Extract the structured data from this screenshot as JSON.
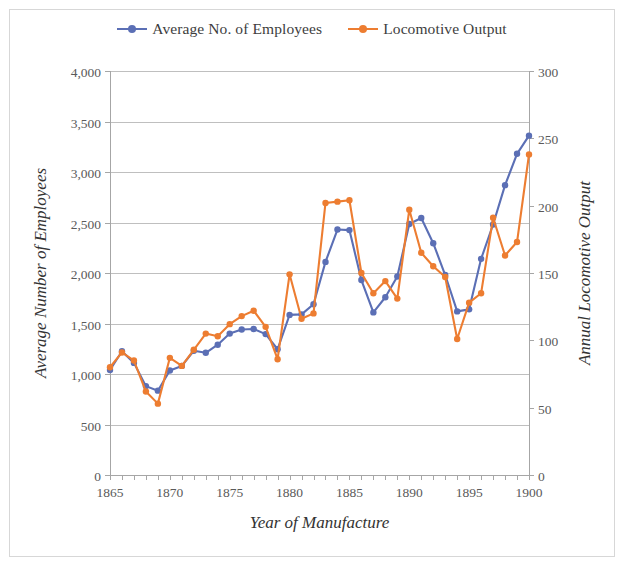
{
  "legend": {
    "entries": [
      {
        "label": "Average No. of Employees",
        "color": "#5B6FB5",
        "key": "legend-key-employees"
      },
      {
        "label": "Locomotive Output",
        "color": "#ED7D31",
        "key": "legend-key-output"
      }
    ]
  },
  "axes": {
    "x": {
      "title": "Year of Manufacture",
      "ticks": [
        "1865",
        "1870",
        "1875",
        "1880",
        "1885",
        "1890",
        "1895",
        "1900"
      ],
      "min": 1865,
      "max": 1900
    },
    "y_left": {
      "title": "Average Number of Employees",
      "ticks": [
        "0",
        "500",
        "1,000",
        "1,500",
        "2,000",
        "2,500",
        "3,000",
        "3,500",
        "4,000"
      ],
      "min": 0,
      "max": 4000
    },
    "y_right": {
      "title": "Annual Locomotive Output",
      "ticks": [
        "0",
        "50",
        "100",
        "150",
        "200",
        "250",
        "300"
      ],
      "min": 0,
      "max": 300
    }
  },
  "chart_data": {
    "type": "line",
    "title": "",
    "xlabel": "Year of Manufacture",
    "ylabel": "Average Number of Employees",
    "y2label": "Annual Locomotive Output",
    "xlim": [
      1865,
      1900
    ],
    "ylim": [
      0,
      4000
    ],
    "y2lim": [
      0,
      300
    ],
    "grid": "horizontal",
    "legend_position": "top-center",
    "x": [
      1865,
      1866,
      1867,
      1868,
      1869,
      1870,
      1871,
      1872,
      1873,
      1874,
      1875,
      1876,
      1877,
      1878,
      1879,
      1880,
      1881,
      1882,
      1883,
      1884,
      1885,
      1886,
      1887,
      1888,
      1889,
      1890,
      1891,
      1892,
      1893,
      1894,
      1895,
      1896,
      1897,
      1898,
      1899,
      1900
    ],
    "series": [
      {
        "name": "Average No. of Employees",
        "axis": "left",
        "color": "#5B6FB5",
        "values": [
          1040,
          1225,
          1110,
          880,
          835,
          1035,
          1080,
          1230,
          1210,
          1290,
          1400,
          1440,
          1445,
          1395,
          1245,
          1585,
          1590,
          1690,
          2110,
          2430,
          2425,
          1930,
          1610,
          1760,
          1965,
          2485,
          2545,
          2295,
          1980,
          1620,
          1640,
          2140,
          2480,
          2870,
          3180,
          3360
        ]
      },
      {
        "name": "Locomotive Output",
        "axis": "right",
        "color": "#ED7D31",
        "values": [
          80,
          91,
          85,
          62,
          53,
          87,
          81,
          93,
          105,
          103,
          112,
          118,
          122,
          110,
          86,
          149,
          116,
          120,
          202,
          203,
          204,
          150,
          135,
          144,
          131,
          197,
          165,
          155,
          147,
          101,
          128,
          135,
          191,
          163,
          173,
          238
        ]
      }
    ]
  }
}
